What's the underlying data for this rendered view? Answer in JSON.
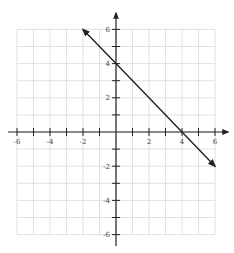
{
  "chart_data": {
    "type": "line",
    "title": "",
    "xlabel": "",
    "ylabel": "",
    "xlim": [
      -6,
      6
    ],
    "ylim": [
      -6,
      6
    ],
    "grid": true,
    "grid_step": 1,
    "x_tick_labels": [
      "-6",
      "-4",
      "-2",
      "2",
      "4",
      "6"
    ],
    "x_tick_values": [
      -6,
      -4,
      -2,
      2,
      4,
      6
    ],
    "y_tick_labels": [
      "6",
      "4",
      "2",
      "-2",
      "-4",
      "-6"
    ],
    "y_tick_values": [
      6,
      4,
      2,
      -2,
      -4,
      -6
    ],
    "series": [
      {
        "name": "y = -x + 4",
        "equation": "y = -x + 4",
        "x": [
          -2,
          0,
          4,
          6
        ],
        "y": [
          6,
          4,
          0,
          -2
        ],
        "arrows_both_ends": true,
        "color": "#222222"
      }
    ],
    "colors": {
      "grid": "#d9d9d9",
      "axis": "#222222",
      "line": "#222222"
    }
  }
}
